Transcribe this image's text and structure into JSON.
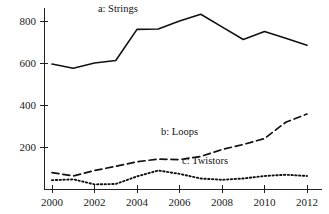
{
  "chart_data": {
    "type": "line",
    "title": "",
    "xlabel": "",
    "ylabel": "",
    "x": [
      2000,
      2001,
      2002,
      2003,
      2004,
      2005,
      2006,
      2007,
      2008,
      2009,
      2010,
      2011,
      2012
    ],
    "xlim": [
      1999.4,
      2012.8
    ],
    "ylim": [
      0,
      880
    ],
    "xticks": [
      2000,
      2002,
      2004,
      2006,
      2008,
      2010,
      2012
    ],
    "xticklabels": [
      "2000",
      "2002",
      "2004",
      "2006",
      "2008",
      "2010",
      "2012"
    ],
    "yticks": [
      200,
      400,
      600,
      800
    ],
    "yticklabels": [
      "200",
      "400",
      "600",
      "800"
    ],
    "grid": false,
    "legend_position": "inline-annotations",
    "series": [
      {
        "name": "a: Strings",
        "label": "a: Strings",
        "linestyle": "solid",
        "color": "#111111",
        "values": [
          595,
          575,
          600,
          612,
          760,
          762,
          800,
          832,
          772,
          712,
          750,
          718,
          685
        ]
      },
      {
        "name": "b: Loops",
        "label": "b: Loops",
        "linestyle": "dashed",
        "color": "#111111",
        "values": [
          78,
          62,
          88,
          108,
          130,
          142,
          140,
          155,
          188,
          212,
          240,
          318,
          357
        ]
      },
      {
        "name": "c: Twistors",
        "label": "c: Twistors",
        "linestyle": "dotted",
        "color": "#111111",
        "values": [
          42,
          46,
          22,
          24,
          60,
          88,
          72,
          50,
          44,
          50,
          62,
          68,
          62
        ]
      }
    ],
    "annotations": [
      {
        "text": "a: Strings",
        "x": 2003.1,
        "y": 845
      },
      {
        "text": "b: Loops",
        "x": 2006.0,
        "y": 258
      },
      {
        "text": "c: Twistors",
        "x": 2007.2,
        "y": 120
      }
    ]
  }
}
